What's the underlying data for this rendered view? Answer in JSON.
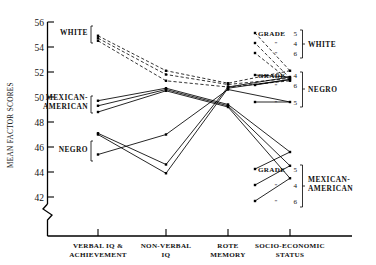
{
  "chart_data": {
    "type": "line",
    "title": "",
    "xlabel": "",
    "ylabel": "MEAN FACTOR SCORES",
    "categories": [
      "VERBAL IQ & ACHIEVEMENT",
      "NON-VERBAL IQ",
      "ROTE MEMORY",
      "SOCIO-ECONOMIC STATUS"
    ],
    "yticks": [
      42,
      44,
      46,
      48,
      50,
      52,
      54,
      56
    ],
    "ylim": [
      41.2,
      56.4
    ],
    "y_axis_break": true,
    "grid": false,
    "legend_position": "right",
    "series": [
      {
        "name": "WHITE Grade 5",
        "group": "WHITE",
        "grade": 5,
        "style": "dashed",
        "values": [
          54.9,
          52.1,
          51.1,
          52.1
        ]
      },
      {
        "name": "WHITE Grade 4",
        "group": "WHITE",
        "grade": 4,
        "style": "dashed",
        "values": [
          54.7,
          51.8,
          51.0,
          51.5
        ]
      },
      {
        "name": "WHITE Grade 6",
        "group": "WHITE",
        "grade": 6,
        "style": "dashed",
        "values": [
          54.5,
          51.3,
          50.8,
          51.3
        ]
      },
      {
        "name": "NEGRO Grade 4",
        "group": "NEGRO",
        "grade": 4,
        "style": "solid",
        "values": [
          47.1,
          44.6,
          50.8,
          51.6
        ]
      },
      {
        "name": "NEGRO Grade 6",
        "group": "NEGRO",
        "grade": 6,
        "style": "solid",
        "values": [
          47.0,
          43.9,
          50.7,
          51.4
        ]
      },
      {
        "name": "NEGRO Grade 5",
        "group": "NEGRO",
        "grade": 5,
        "style": "solid",
        "values": [
          45.4,
          47.0,
          50.6,
          49.6
        ]
      },
      {
        "name": "MEXICAN-AMERICAN Grade 5",
        "group": "MEXICAN-AMERICAN",
        "grade": 5,
        "style": "solid",
        "values": [
          49.7,
          50.7,
          49.4,
          45.6
        ]
      },
      {
        "name": "MEXICAN-AMERICAN Grade 4",
        "group": "MEXICAN-AMERICAN",
        "grade": 4,
        "style": "solid",
        "values": [
          49.3,
          50.6,
          49.3,
          44.5
        ]
      },
      {
        "name": "MEXICAN-AMERICAN Grade 6",
        "group": "MEXICAN-AMERICAN",
        "grade": 6,
        "style": "solid",
        "values": [
          48.8,
          50.5,
          49.2,
          43.5
        ]
      }
    ],
    "left_group_labels": [
      {
        "text": "WHITE",
        "value": 54.7
      },
      {
        "text": "MEXICAN-",
        "value": 49.7
      },
      {
        "text": "AMERICAN",
        "value": 49.0
      },
      {
        "text": "NEGRO",
        "value": 46.3
      }
    ],
    "legend_blocks": [
      {
        "group": "WHITE",
        "title": "GRADE",
        "rows": [
          {
            "prefix": "GRADE",
            "grade": "5"
          },
          {
            "prefix": "\"",
            "grade": "4"
          },
          {
            "prefix": "\"",
            "grade": "6"
          }
        ]
      },
      {
        "group": "NEGRO",
        "title": "GRADE",
        "rows": [
          {
            "prefix": "GRADE",
            "grade": "4"
          },
          {
            "prefix": "\"",
            "grade": "6"
          },
          {
            "prefix": "\"",
            "grade": "5"
          }
        ]
      },
      {
        "group": "MEXICAN-AMERICAN",
        "title": "GRADE",
        "rows": [
          {
            "prefix": "GRADE",
            "grade": "5"
          },
          {
            "prefix": "\"",
            "grade": "4"
          },
          {
            "prefix": "\"",
            "grade": "6"
          }
        ]
      }
    ]
  },
  "labels": {
    "ylabel": "MEAN FACTOR SCORES",
    "t56": "56",
    "t54": "54",
    "t52": "52",
    "t50": "50",
    "t48": "48",
    "t46": "46",
    "t44": "44",
    "t42": "42",
    "cat1a": "VERBAL  IQ &",
    "cat1b": "ACHIEVEMENT",
    "cat2a": "NON-VERBAL",
    "cat2b": "IQ",
    "cat3a": "ROTE",
    "cat3b": "MEMORY",
    "cat4a": "SOCIO-ECONOMIC",
    "cat4b": "STATUS",
    "gWhite": "WHITE",
    "gMexA": "MEXICAN-",
    "gMexB": "AMERICAN",
    "gNegro": "NEGRO",
    "legWhiteGrade": "GRADE",
    "legWhite5": "5",
    "legWhiteD1": "\"",
    "legWhite4": "4",
    "legWhiteD2": "\"",
    "legWhite6": "6",
    "legWhiteName": "WHITE",
    "legNegroGrade": "GRADE",
    "legNegro4": "4",
    "legNegroD1": "\"",
    "legNegro6": "6",
    "legNegroD2": "\"",
    "legNegro5": "5",
    "legNegroName": "NEGRO",
    "legMexGrade": "GRADE",
    "legMex5": "5",
    "legMexD1": "\"",
    "legMex4": "4",
    "legMexD2": "\"",
    "legMex6": "6",
    "legMexNameA": "MEXICAN-",
    "legMexNameB": "AMERICAN"
  },
  "colors": {
    "ink": "#000000",
    "background": "#ffffff"
  }
}
